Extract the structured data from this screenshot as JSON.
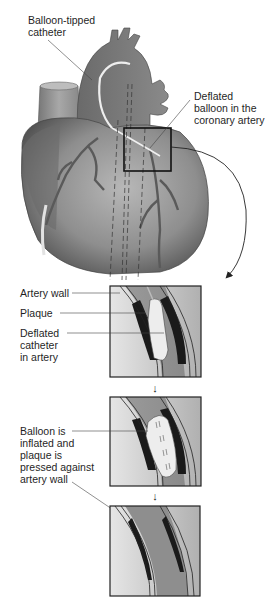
{
  "diagram": {
    "heart_labels": {
      "catheter": "Balloon-tipped\ncatheter",
      "deflated_balloon": "Deflated\nballoon in the\ncoronary artery"
    },
    "step1_labels": {
      "artery_wall": "Artery wall",
      "plaque": "Plaque",
      "deflated_catheter": "Deflated\ncatheter\nin artery"
    },
    "step2_labels": {
      "inflated": "Balloon is\ninflated and\nplaque is\npressed against\nartery wall"
    },
    "colors": {
      "heart_dark": "#5a5a5a",
      "heart_mid": "#8a8a8a",
      "heart_light": "#b5b5b5",
      "vessel_light": "#d8d8d8",
      "plaque": "#1a1a1a",
      "balloon": "#ececec",
      "box_border": "#222222"
    }
  }
}
